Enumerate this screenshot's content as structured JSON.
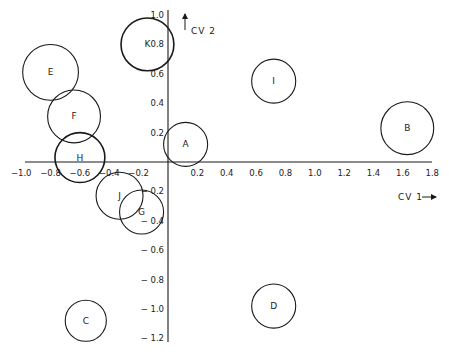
{
  "chart_data": {
    "type": "scatter",
    "subtype": "bubble / group-mean circles",
    "title": "",
    "xlabel": "CV 1",
    "ylabel": "CV 2",
    "xlim": [
      -1.0,
      1.8
    ],
    "ylim": [
      -1.2,
      1.0
    ],
    "grid": false,
    "legend": null,
    "x_ticks": [
      "-1.0",
      "-0.8",
      "-0.6",
      "-0.4",
      "-0.2",
      "0.2",
      "0.4",
      "0.6",
      "0.8",
      "1.0",
      "1.2",
      "1.4",
      "1.6",
      "1.8"
    ],
    "y_ticks": [
      "1.0",
      "0.8",
      "0.6",
      "0.4",
      "0.2",
      "-0.2",
      "-0.4",
      "-0.6",
      "-0.8",
      "-1.0",
      "-1.2"
    ],
    "points": [
      {
        "label": "A",
        "x": 0.12,
        "y": 0.12,
        "r": 0.15
      },
      {
        "label": "B",
        "x": 1.63,
        "y": 0.23,
        "r": 0.18
      },
      {
        "label": "C",
        "x": -0.56,
        "y": -1.08,
        "r": 0.14
      },
      {
        "label": "D",
        "x": 0.72,
        "y": -0.98,
        "r": 0.15
      },
      {
        "label": "E",
        "x": -0.8,
        "y": 0.61,
        "r": 0.19
      },
      {
        "label": "F",
        "x": -0.64,
        "y": 0.31,
        "r": 0.18
      },
      {
        "label": "G",
        "x": -0.18,
        "y": -0.34,
        "r": 0.15
      },
      {
        "label": "H",
        "x": -0.6,
        "y": 0.03,
        "r": 0.17
      },
      {
        "label": "I",
        "x": 0.72,
        "y": 0.55,
        "r": 0.15
      },
      {
        "label": "J",
        "x": -0.33,
        "y": -0.23,
        "r": 0.16
      },
      {
        "label": "K",
        "x": -0.14,
        "y": 0.8,
        "r": 0.18
      }
    ]
  },
  "axes": {
    "x_title": "CV 1",
    "y_title": "CV 2"
  },
  "colors": {
    "ink": "#1a1a1a",
    "background": "#ffffff"
  }
}
